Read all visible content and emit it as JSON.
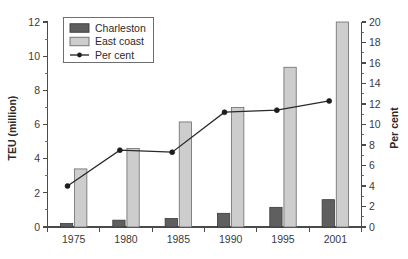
{
  "chart_data": {
    "type": "bar",
    "title": "",
    "subtitle": "",
    "xlabel": "",
    "ylabel": "TEU (million)",
    "y2label": "Per cent",
    "categories": [
      "1975",
      "1980",
      "1985",
      "1990",
      "1995",
      "2001"
    ],
    "ylim": [
      0,
      12
    ],
    "y2lim": [
      0,
      20
    ],
    "yticks": [
      0,
      2,
      4,
      6,
      8,
      10,
      12
    ],
    "y2ticks": [
      0,
      2,
      4,
      6,
      8,
      10,
      12,
      14,
      16,
      18,
      20
    ],
    "ytick_labels": [
      "0",
      "2",
      "4",
      "6",
      "8",
      "10",
      "12"
    ],
    "y2tick_labels": [
      "0",
      "2",
      "4",
      "6",
      "8",
      "10",
      "12",
      "14",
      "16",
      "18",
      "20"
    ],
    "grid": false,
    "legend_position": "top-left",
    "series": [
      {
        "name": "Charleston",
        "kind": "bar",
        "axis": "left",
        "color": "#5f5f5f",
        "values": [
          0.2,
          0.4,
          0.5,
          0.8,
          1.15,
          1.6
        ]
      },
      {
        "name": "East coast",
        "kind": "bar",
        "axis": "left",
        "color": "#cdcdcd",
        "values": [
          3.4,
          4.6,
          6.15,
          7.0,
          9.35,
          12.0
        ]
      },
      {
        "name": "Per cent",
        "kind": "line",
        "axis": "right",
        "color": "#1d1d1d",
        "values": [
          4.0,
          7.5,
          7.3,
          11.2,
          11.4,
          12.3
        ]
      }
    ]
  },
  "legend": {
    "entries": [
      {
        "label": "Charleston",
        "marker": "filled-square-dark"
      },
      {
        "label": "East coast",
        "marker": "filled-square-light"
      },
      {
        "label": "Per cent",
        "marker": "line-with-dot"
      }
    ]
  },
  "axes": {
    "left_title": "TEU (million)",
    "right_title": "Per cent"
  }
}
